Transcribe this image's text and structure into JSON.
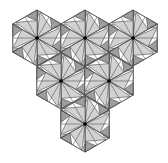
{
  "diagram": {
    "type": "hexagonal-pinwheel-tiling",
    "hexagon_count": 6,
    "arrangement": "inverted triangle (3 top, 2 middle, 1 bottom)",
    "hexagon_radius": 28,
    "orientation": "pointy-top",
    "hexagons": [
      {
        "id": "hex-top-left",
        "cx": 37,
        "cy": 38
      },
      {
        "id": "hex-top-center",
        "cx": 85,
        "cy": 38
      },
      {
        "id": "hex-top-right",
        "cx": 133,
        "cy": 38
      },
      {
        "id": "hex-middle-left",
        "cx": 61,
        "cy": 81
      },
      {
        "id": "hex-middle-right",
        "cx": 109,
        "cy": 81
      },
      {
        "id": "hex-bottom",
        "cx": 85,
        "cy": 124
      }
    ],
    "blades_per_hexagon": 6,
    "colors": {
      "background": "#ffffff",
      "light_fill": "#d2d2d2",
      "dark_fill": "#9e9e9e",
      "line": "#3a3a3a",
      "hub": "#000000"
    }
  }
}
